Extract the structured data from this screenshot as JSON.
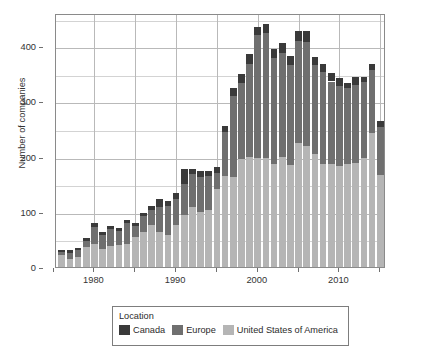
{
  "chart_data": {
    "type": "bar",
    "subtype": "stacked-vertical",
    "title": "",
    "subtitle": "",
    "xlabel": "",
    "ylabel": "Number of companies",
    "xlim": [
      1975.3,
      2015.7
    ],
    "ylim": [
      0,
      460
    ],
    "grid": true,
    "y_ticks": [
      0,
      100,
      200,
      300,
      400
    ],
    "y_tick_labels": [
      "0",
      "100",
      "200",
      "300",
      "400"
    ],
    "x_ticks": [
      1980,
      1990,
      2000,
      2010
    ],
    "x_tick_labels": [
      "1980",
      "1990",
      "2000",
      "2010"
    ],
    "x_minor_ticks": [
      1975,
      1985,
      1995,
      2005,
      2015
    ],
    "legend_title": "Location",
    "legend_position": "bottom",
    "categories": [
      1976,
      1977,
      1978,
      1979,
      1980,
      1981,
      1982,
      1983,
      1984,
      1985,
      1986,
      1987,
      1988,
      1989,
      1990,
      1991,
      1992,
      1993,
      1994,
      1995,
      1996,
      1997,
      1998,
      1999,
      2000,
      2001,
      2002,
      2003,
      2004,
      2005,
      2006,
      2007,
      2008,
      2009,
      2010,
      2011,
      2012,
      2013,
      2014,
      2015
    ],
    "series": [
      {
        "name": "United States of America",
        "color": "#b5b5b5",
        "values": [
          22,
          14,
          19,
          36,
          41,
          33,
          38,
          40,
          42,
          55,
          64,
          76,
          64,
          58,
          77,
          94,
          108,
          100,
          104,
          141,
          164,
          163,
          196,
          199,
          197,
          197,
          186,
          199,
          185,
          225,
          220,
          205,
          186,
          186,
          183,
          186,
          189,
          197,
          243,
          166
        ]
      },
      {
        "name": "Europe",
        "color": "#6f6f6f",
        "values": [
          6,
          12,
          11,
          12,
          31,
          25,
          31,
          26,
          38,
          20,
          28,
          27,
          45,
          53,
          46,
          56,
          60,
          63,
          60,
          29,
          81,
          147,
          138,
          169,
          224,
          227,
          193,
          189,
          181,
          185,
          188,
          160,
          167,
          150,
          145,
          138,
          141,
          138,
          113,
          88
        ]
      },
      {
        "name": "Canada",
        "color": "#3a3a3a",
        "values": [
          3,
          4,
          4,
          4,
          7,
          5,
          6,
          5,
          6,
          5,
          5,
          8,
          15,
          9,
          11,
          27,
          9,
          11,
          10,
          11,
          10,
          15,
          16,
          17,
          14,
          16,
          16,
          17,
          17,
          18,
          19,
          15,
          15,
          16,
          15,
          9,
          15,
          10,
          12,
          11
        ]
      }
    ],
    "totals": [
      31,
      30,
      34,
      52,
      79,
      63,
      75,
      71,
      86,
      80,
      97,
      111,
      124,
      120,
      134,
      177,
      177,
      174,
      174,
      181,
      255,
      325,
      350,
      385,
      435,
      440,
      395,
      405,
      383,
      428,
      427,
      380,
      368,
      352,
      343,
      333,
      345,
      345,
      368,
      265
    ]
  },
  "legend": {
    "title": "Location",
    "items": [
      {
        "label": "Canada",
        "color": "#3a3a3a"
      },
      {
        "label": "Europe",
        "color": "#6f6f6f"
      },
      {
        "label": "United States of America",
        "color": "#b5b5b5"
      }
    ]
  },
  "axes": {
    "y_title": "Number of companies"
  }
}
